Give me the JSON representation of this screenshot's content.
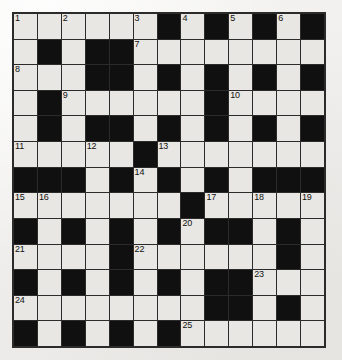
{
  "puzzle": {
    "type": "crossword-grid",
    "title": "Crossword Puzzle Grid",
    "columns": 13,
    "rows": 13,
    "colors": {
      "page_background": "#f2f1ef",
      "white_cell": "#e8e7e3",
      "black_cell": "#101010",
      "grid_line": "#2b2b2b",
      "number_text": "#111111"
    },
    "legend": {
      "W": "white (fillable) cell",
      "B": "black (blocked) cell"
    },
    "clue_count": 25,
    "clue_numbers": [
      1,
      2,
      3,
      4,
      5,
      6,
      7,
      8,
      9,
      10,
      11,
      12,
      13,
      14,
      15,
      16,
      17,
      18,
      19,
      20,
      21,
      22,
      23,
      24,
      25
    ],
    "grid": [
      [
        "W",
        "W",
        "W",
        "W",
        "W",
        "W",
        "B",
        "W",
        "B",
        "W",
        "B",
        "W",
        "B"
      ],
      [
        "W",
        "B",
        "W",
        "B",
        "B",
        "W",
        "W",
        "W",
        "W",
        "W",
        "W",
        "W",
        "W"
      ],
      [
        "W",
        "W",
        "W",
        "B",
        "B",
        "W",
        "B",
        "W",
        "B",
        "W",
        "B",
        "W",
        "B"
      ],
      [
        "W",
        "B",
        "W",
        "W",
        "W",
        "W",
        "W",
        "W",
        "B",
        "W",
        "W",
        "W",
        "W"
      ],
      [
        "W",
        "B",
        "W",
        "B",
        "B",
        "W",
        "B",
        "W",
        "B",
        "W",
        "B",
        "W",
        "B"
      ],
      [
        "W",
        "W",
        "W",
        "W",
        "W",
        "B",
        "W",
        "W",
        "W",
        "W",
        "W",
        "W",
        "W"
      ],
      [
        "B",
        "B",
        "B",
        "W",
        "B",
        "W",
        "B",
        "W",
        "B",
        "W",
        "B",
        "B",
        "B"
      ],
      [
        "W",
        "W",
        "W",
        "W",
        "W",
        "W",
        "W",
        "B",
        "W",
        "W",
        "W",
        "W",
        "W"
      ],
      [
        "B",
        "W",
        "B",
        "W",
        "B",
        "W",
        "B",
        "W",
        "B",
        "B",
        "W",
        "B",
        "W"
      ],
      [
        "W",
        "W",
        "W",
        "W",
        "B",
        "W",
        "W",
        "W",
        "W",
        "W",
        "W",
        "B",
        "W"
      ],
      [
        "B",
        "W",
        "B",
        "W",
        "B",
        "W",
        "B",
        "W",
        "B",
        "B",
        "W",
        "W",
        "W"
      ],
      [
        "W",
        "W",
        "W",
        "W",
        "W",
        "W",
        "W",
        "W",
        "B",
        "B",
        "W",
        "B",
        "W"
      ],
      [
        "B",
        "W",
        "B",
        "W",
        "B",
        "W",
        "B",
        "W",
        "W",
        "W",
        "W",
        "W",
        "W"
      ]
    ],
    "numbers": [
      [
        "1",
        "",
        "2",
        "",
        "",
        "3",
        "",
        "4",
        "",
        "5",
        "",
        "6",
        ""
      ],
      [
        "",
        "",
        "",
        "",
        "",
        "7",
        "",
        "",
        "",
        "",
        "",
        "",
        ""
      ],
      [
        "8",
        "",
        "",
        "",
        "",
        "",
        "",
        "",
        "",
        "",
        "",
        "",
        ""
      ],
      [
        "",
        "",
        "9",
        "",
        "",
        "",
        "",
        "",
        "",
        "10",
        "",
        "",
        ""
      ],
      [
        "",
        "",
        "",
        "",
        "",
        "",
        "",
        "",
        "",
        "",
        "",
        "",
        ""
      ],
      [
        "11",
        "",
        "",
        "12",
        "",
        "",
        "13",
        "",
        "",
        "",
        "",
        "",
        ""
      ],
      [
        "",
        "",
        "",
        "",
        "",
        "14",
        "",
        "",
        "",
        "",
        "",
        "",
        ""
      ],
      [
        "15",
        "16",
        "",
        "",
        "",
        "",
        "",
        "",
        "17",
        "",
        "18",
        "",
        "19"
      ],
      [
        "",
        "",
        "",
        "",
        "",
        "",
        "",
        "20",
        "",
        "",
        "",
        "",
        ""
      ],
      [
        "21",
        "",
        "",
        "",
        "",
        "22",
        "",
        "",
        "",
        "",
        "",
        "",
        ""
      ],
      [
        "",
        "",
        "",
        "",
        "",
        "",
        "",
        "",
        "",
        "",
        "23",
        "",
        ""
      ],
      [
        "24",
        "",
        "",
        "",
        "",
        "",
        "",
        "",
        "",
        "",
        "",
        "",
        ""
      ],
      [
        "",
        "",
        "",
        "",
        "",
        "",
        "",
        "25",
        "",
        "",
        "",
        "",
        ""
      ]
    ]
  }
}
